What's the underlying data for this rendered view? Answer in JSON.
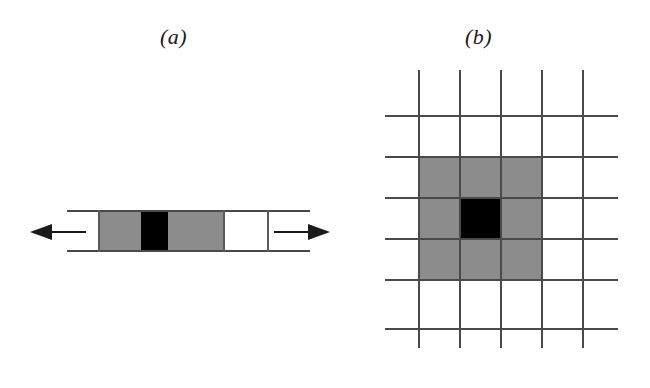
{
  "figure": {
    "width": 650,
    "height": 388,
    "background_color": "#ffffff",
    "panels": [
      {
        "id": "a",
        "label": "(a)",
        "label_position": {
          "x": 160,
          "y": 24
        },
        "description": "one-dimensional strip of cells between two horizontal rails with arrows pointing outward on both sides",
        "colors": {
          "gray": "#8c8c8c",
          "black": "#000000",
          "white": "#ffffff",
          "line": "#4a4a4a"
        },
        "rails": [
          {
            "name": "rail-top",
            "x": 67,
            "y": 210,
            "length": 243
          },
          {
            "name": "rail-bottom",
            "x": 67,
            "y": 250,
            "length": 243
          }
        ],
        "cells": [
          {
            "index": 1,
            "fill": "gray",
            "x": 99,
            "width": 42
          },
          {
            "index": 2,
            "fill": "black",
            "x": 141,
            "width": 27
          },
          {
            "index": 3,
            "fill": "gray",
            "x": 168,
            "width": 56
          },
          {
            "index": 4,
            "fill": "white",
            "x": 224,
            "width": 44
          },
          {
            "index": 5,
            "fill": "white",
            "x": 268,
            "width": 42
          }
        ],
        "dividers": [
          {
            "x": 99
          },
          {
            "x": 224
          },
          {
            "x": 268
          }
        ],
        "arrows": [
          {
            "name": "arrow-left",
            "direction": "left",
            "x": 30,
            "y": 231
          },
          {
            "name": "arrow-right",
            "direction": "right",
            "x": 274,
            "y": 231
          }
        ]
      },
      {
        "id": "b",
        "label": "(b)",
        "label_position": {
          "x": 465,
          "y": 24
        },
        "description": "two-dimensional grid with a 3x3 gray neighbourhood block and a single black center cell",
        "colors": {
          "gray": "#8c8c8c",
          "black": "#000000",
          "white": "#ffffff",
          "line": "#4a4a4a"
        },
        "grid": {
          "vertical_lines_x": [
            418,
            459,
            500,
            541,
            582
          ],
          "horizontal_lines_y": [
            115,
            156,
            197,
            238,
            279,
            328
          ],
          "v_line_top": 70,
          "v_line_bottom": 348,
          "h_line_left": 385,
          "h_line_right": 618,
          "columns": 4,
          "rows": 5
        },
        "gray_block": {
          "x": 418,
          "y": 156,
          "width": 123,
          "height": 123,
          "cells": 9
        },
        "black_cell": {
          "x": 459,
          "y": 197,
          "width": 41,
          "height": 41,
          "cells": 1
        }
      }
    ]
  }
}
